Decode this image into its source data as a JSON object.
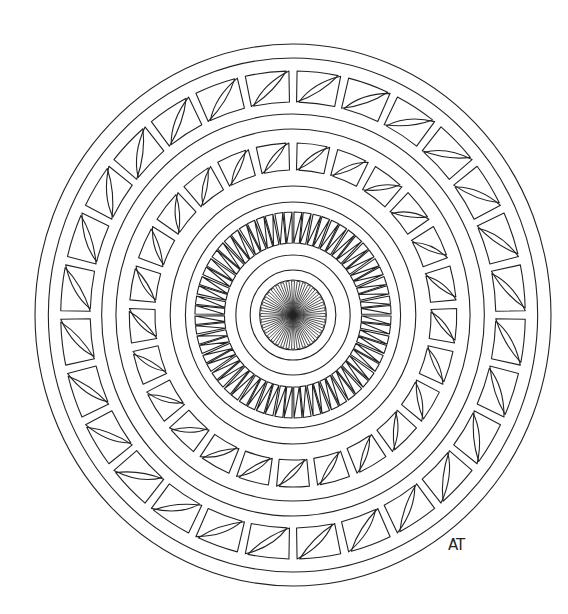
{
  "artwork": {
    "type": "mandala line drawing",
    "signature": "AT",
    "stroke_color": "#222222",
    "background_color": "#ffffff",
    "center": [
      293,
      315
    ],
    "x_scale": 0.952,
    "circles": [
      271,
      257,
      201,
      186,
      129,
      113,
      60,
      45,
      35
    ],
    "bands": [
      {
        "name": "outer-tile-ring",
        "r_outer": 244,
        "r_inner": 213,
        "tiles": 28
      },
      {
        "name": "middle-tile-ring",
        "r_outer": 172,
        "r_inner": 145,
        "tiles": 25
      },
      {
        "name": "inner-zigzag-ring",
        "r_outer": 103,
        "r_inner": 72,
        "tiles": 32
      }
    ],
    "hub": {
      "r": 35,
      "spokes": 36
    }
  }
}
